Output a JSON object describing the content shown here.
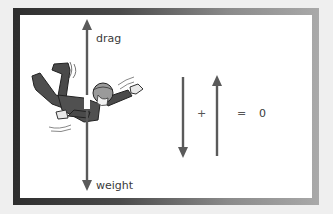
{
  "diagram": {
    "force_labels": {
      "drag": "drag",
      "weight": "weight"
    },
    "equation": {
      "plus": "+",
      "equals": "=",
      "result": "0"
    },
    "colors": {
      "arrow": "#5a5a5a",
      "text": "#3a3a3a",
      "frame_dark": "#2e2e2e",
      "frame_light": "#a9a9a9",
      "background": "#ffffff"
    },
    "figure": "skydiver in free fall"
  }
}
